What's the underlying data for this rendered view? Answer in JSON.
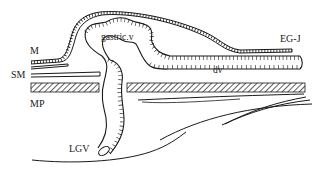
{
  "diagram": {
    "type": "anatomical-line-drawing",
    "labels": {
      "mucosa": "M",
      "submucosa": "SM",
      "muscularis_propria": "MP",
      "gastric_vein": "gastric.v",
      "egj": "EG-J",
      "dilated_vein": "dv",
      "left_gastric_vein": "LGV"
    },
    "colors": {
      "ink": "#1a1a1a",
      "background": "#ffffff"
    }
  }
}
